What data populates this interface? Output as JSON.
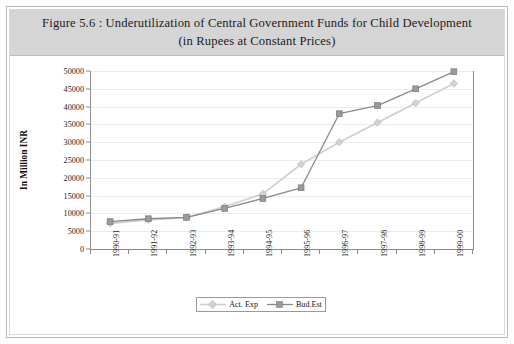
{
  "figure": {
    "title_line1": "Figure 5.6 : Underutilization of Central Government Funds for Child Development",
    "title_line2": "(in Rupees at Constant Prices)"
  },
  "chart_data": {
    "type": "line",
    "title": "Figure 5.6 : Underutilization of Central Government Funds for Child Development (in Rupees at Constant Prices)",
    "xlabel": "",
    "ylabel": "In Million INR",
    "categories": [
      "1990-91",
      "1991-92",
      "1992-93",
      "1993-94",
      "1994-95",
      "1995-96",
      "1996-97",
      "1997-98",
      "1998-99",
      "1999-00"
    ],
    "yticks": [
      0,
      5000,
      10000,
      15000,
      20000,
      25000,
      30000,
      35000,
      40000,
      45000,
      50000
    ],
    "ytick_labels": [
      "0",
      "5000",
      "10000",
      "15000",
      "20000",
      "25000",
      "30000",
      "35000",
      "40000",
      "45000",
      "50000"
    ],
    "ylim": [
      0,
      50000
    ],
    "grid": true,
    "legend_position": "bottom-center",
    "series": [
      {
        "name": "Act. Exp",
        "color": "#d0d0d0",
        "marker": "diamond",
        "values": [
          7200,
          8200,
          8800,
          11900,
          15500,
          23800,
          30000,
          35500,
          41000,
          46500
        ]
      },
      {
        "name": "Bud.Est",
        "color": "#8a8a8a",
        "marker": "square",
        "values": [
          7700,
          8500,
          8900,
          11400,
          14200,
          17200,
          38000,
          40300,
          45000,
          49800
        ]
      }
    ]
  },
  "legend": {
    "items": [
      {
        "label": "Act. Exp"
      },
      {
        "label": "Bud.Est"
      }
    ]
  },
  "colors": {
    "title_band": "#d5d5d5",
    "axis": "#8c8c8c",
    "gridline": "#ececec",
    "series_act_exp": "#d0d0d0",
    "series_bud_est": "#8a8a8a"
  }
}
